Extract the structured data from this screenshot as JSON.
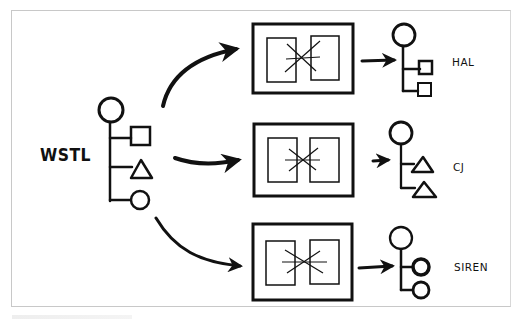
{
  "diagram": {
    "type": "hand-drawn flow diagram",
    "source": {
      "label": "WSTL",
      "tree": {
        "root": "circle",
        "children": [
          "square",
          "triangle",
          "circle"
        ]
      }
    },
    "processors": [
      {
        "name": "transform-box-1",
        "icon": "merge-cross-icon"
      },
      {
        "name": "transform-box-2",
        "icon": "merge-cross-icon"
      },
      {
        "name": "transform-box-3",
        "icon": "merge-cross-icon"
      }
    ],
    "targets": [
      {
        "label": "HAL",
        "tree": {
          "root": "circle",
          "children": [
            "square",
            "square"
          ]
        }
      },
      {
        "label": "CJ",
        "tree": {
          "root": "circle",
          "children": [
            "triangle",
            "triangle"
          ]
        }
      },
      {
        "label": "SIREN",
        "tree": {
          "root": "circle",
          "children": [
            "circle",
            "circle"
          ]
        }
      }
    ],
    "colors": {
      "ink": "#111111",
      "frame": "#c8c8c8",
      "background": "#ffffff"
    }
  }
}
